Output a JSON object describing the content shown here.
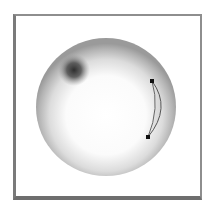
{
  "figure": {
    "colors": {
      "frame": "#7a7a7a",
      "sphere_light": "#ffffff",
      "sphere_edge": "#9a9a9a",
      "spot": "#2e2e2e",
      "path": "#555555",
      "anchor": "#111111"
    },
    "sphere": {
      "cx": 106,
      "cy": 107,
      "r": 70
    },
    "spot": {
      "cx": 74,
      "cy": 70,
      "r": 12
    },
    "anchors": [
      {
        "x": 152,
        "y": 81
      },
      {
        "x": 148,
        "y": 137
      }
    ]
  }
}
